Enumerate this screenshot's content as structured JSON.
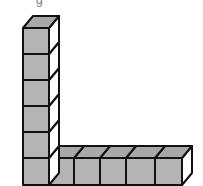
{
  "figure": {
    "partial_label": "g",
    "colors": {
      "front_face": "#b4b4b4",
      "top_face": "#a8a8a8",
      "side_face": "#ffffff",
      "edge": "#111111"
    },
    "vertical_column_cubes": 6,
    "horizontal_row_cubes": 6,
    "shared_corner_cube": true,
    "total_cubes": 11
  }
}
